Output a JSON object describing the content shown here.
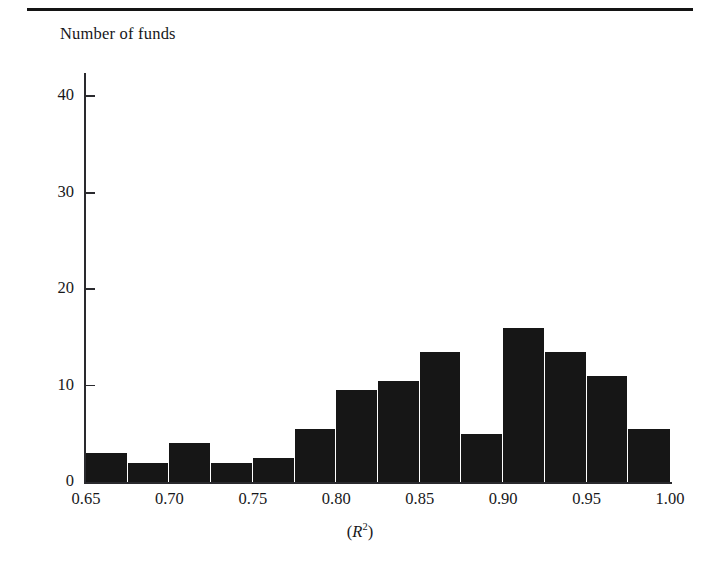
{
  "figure": {
    "y_axis_title": "Number of funds",
    "x_axis_title_prefix": "(",
    "x_axis_title_symbol": "R",
    "x_axis_title_exponent": "2",
    "x_axis_title_suffix": ")",
    "accent_color": "#161616",
    "axis_color": "#2a2a2e",
    "background_color": "#ffffff"
  },
  "chart_data": {
    "type": "bar",
    "title": "",
    "subtitle": "",
    "xlabel": "(R2)",
    "ylabel": "Number of funds",
    "xlim": [
      0.65,
      1.0
    ],
    "ylim": [
      0,
      42
    ],
    "grid": false,
    "legend": "none",
    "bin_width": 0.025,
    "x_ticks": [
      0.65,
      0.7,
      0.75,
      0.8,
      0.85,
      0.9,
      0.95,
      1.0
    ],
    "x_tick_labels": [
      "0.65",
      "0.70",
      "0.75",
      "0.80",
      "0.85",
      "0.90",
      "0.95",
      "1.00"
    ],
    "y_ticks": [
      0,
      10,
      20,
      30,
      40
    ],
    "y_tick_labels": [
      "0",
      "10",
      "20",
      "30",
      "40"
    ],
    "bins": [
      {
        "start": 0.65,
        "end": 0.675,
        "value": 3.0
      },
      {
        "start": 0.675,
        "end": 0.7,
        "value": 2.0
      },
      {
        "start": 0.7,
        "end": 0.725,
        "value": 4.0
      },
      {
        "start": 0.725,
        "end": 0.75,
        "value": 2.0
      },
      {
        "start": 0.75,
        "end": 0.775,
        "value": 2.5
      },
      {
        "start": 0.775,
        "end": 0.8,
        "value": 5.5
      },
      {
        "start": 0.8,
        "end": 0.825,
        "value": 9.5
      },
      {
        "start": 0.825,
        "end": 0.85,
        "value": 10.5
      },
      {
        "start": 0.85,
        "end": 0.875,
        "value": 13.5
      },
      {
        "start": 0.875,
        "end": 0.9,
        "value": 5.0
      },
      {
        "start": 0.9,
        "end": 0.925,
        "value": 16.0
      },
      {
        "start": 0.925,
        "end": 0.95,
        "value": 13.5
      },
      {
        "start": 0.95,
        "end": 0.975,
        "value": 11.0
      },
      {
        "start": 0.975,
        "end": 1.0,
        "value": 5.5
      }
    ],
    "categories": [
      "0.650-0.675",
      "0.675-0.700",
      "0.700-0.725",
      "0.725-0.750",
      "0.750-0.775",
      "0.775-0.800",
      "0.800-0.825",
      "0.825-0.850",
      "0.850-0.875",
      "0.875-0.900",
      "0.900-0.925",
      "0.925-0.950",
      "0.950-0.975",
      "0.975-1.000"
    ],
    "values": [
      3.0,
      2.0,
      4.0,
      2.0,
      2.5,
      5.5,
      9.5,
      10.5,
      13.5,
      5.0,
      16.0,
      13.5,
      11.0,
      5.5
    ]
  }
}
